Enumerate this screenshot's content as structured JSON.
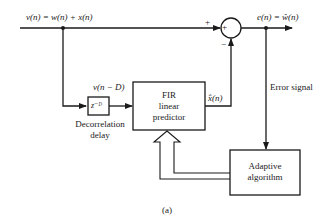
{
  "diagram": {
    "caption": "(a)",
    "input_signal_label": "v(n) = w(n) + x(n)",
    "plus_sign": "+",
    "minus_sign": "−",
    "summing_symbol": "+",
    "output_label": "e(n) = ŵ(n)",
    "delay_output_label": "v(n − D)",
    "delay_block": {
      "label": "z⁻ᴰ",
      "caption_line1": "Decorrelation",
      "caption_line2": "delay"
    },
    "predictor_block": {
      "line1": "FIR",
      "line2": "linear",
      "line3": "predictor"
    },
    "predictor_output_label": "x̂(n)",
    "error_signal_label": "Error signal",
    "adaptive_block": {
      "line1": "Adaptive",
      "line2": "algorithm"
    }
  }
}
